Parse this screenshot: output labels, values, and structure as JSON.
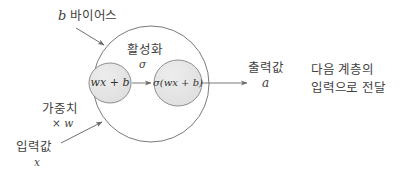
{
  "diagram": {
    "colors": {
      "stroke": "#6b6b6b",
      "node_fill": "#e3e3e3",
      "text": "#3f3f3f",
      "background": "#ffffff"
    },
    "outer_node": {
      "name": "neuron-body",
      "cx": 151,
      "cy": 84,
      "r": 58
    },
    "inner_nodes": [
      {
        "name": "linear-combination-node",
        "label": "wx + b",
        "cx": 110,
        "cy": 83,
        "rx": 21,
        "ry": 20
      },
      {
        "name": "activation-output-node",
        "label": "σ(wx + b)",
        "cx": 178,
        "cy": 83,
        "rx": 24,
        "ry": 23
      }
    ],
    "labels": {
      "bias_symbol": "b",
      "bias_text": "바이어스",
      "activation_text": "활성화",
      "activation_symbol": "σ",
      "output_text": "출력값",
      "output_symbol": "a",
      "weight_text": "가중치",
      "weight_symbol": "× w",
      "input_text": "입력값",
      "input_symbol": "x",
      "next_layer_line1": "다음 계층의",
      "next_layer_line2": "입력으로 전달"
    },
    "arrows": [
      {
        "name": "bias-pointer-arrow",
        "from": [
          76,
          28
        ],
        "to": [
          106,
          46
        ]
      },
      {
        "name": "internal-flow-arrow",
        "from": [
          132,
          83
        ],
        "to": [
          153,
          83
        ]
      },
      {
        "name": "output-arrow",
        "from": [
          201,
          83
        ],
        "to": [
          249,
          83
        ]
      },
      {
        "name": "input-weight-pointer-arrow",
        "from": [
          61,
          143
        ],
        "to": [
          104,
          121
        ]
      }
    ]
  }
}
